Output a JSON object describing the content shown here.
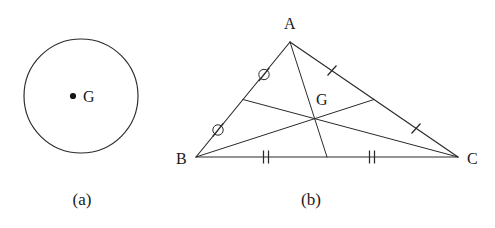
{
  "figure": {
    "width": 495,
    "height": 228,
    "background_color": "#ffffff",
    "stroke_color": "#2a2a2a",
    "text_color": "#1a1a1a"
  },
  "panel_a": {
    "caption": "(a)",
    "caption_x": 82,
    "caption_y": 205,
    "shape": "circle",
    "circle": {
      "cx": 81,
      "cy": 96,
      "r": 57
    },
    "center_point": {
      "label": "G",
      "dot_x": 73,
      "dot_y": 96,
      "dot_r": 3.1,
      "label_x": 83,
      "label_y": 102
    }
  },
  "panel_b": {
    "caption": "(b)",
    "caption_x": 311,
    "caption_y": 205,
    "shape": "triangle-with-medians",
    "vertices": [
      {
        "name": "A",
        "x": 290,
        "y": 42,
        "label": "A",
        "label_x": 284,
        "label_y": 29
      },
      {
        "name": "B",
        "x": 196,
        "y": 157,
        "label": "B",
        "label_x": 176,
        "label_y": 164
      },
      {
        "name": "C",
        "x": 458,
        "y": 157,
        "label": "C",
        "label_x": 467,
        "label_y": 164
      }
    ],
    "centroid": {
      "name": "G",
      "x": 315,
      "y": 119,
      "label": "G",
      "label_x": 316,
      "label_y": 105
    },
    "midpoints": [
      {
        "name": "midpoint-AB",
        "x": 243,
        "y": 99.5
      },
      {
        "name": "midpoint-AC",
        "x": 374,
        "y": 99.5
      },
      {
        "name": "midpoint-BC",
        "x": 327,
        "y": 157
      }
    ],
    "medians": [
      {
        "name": "median-A-to-BC",
        "from": "A",
        "to": "midpoint-BC"
      },
      {
        "name": "median-B-to-AC",
        "from": "B",
        "to": "midpoint-AC"
      },
      {
        "name": "median-C-to-AB",
        "from": "C",
        "to": "midpoint-AB"
      }
    ],
    "tick_marks": [
      {
        "name": "tick-AB-upper",
        "style": "circle-slash",
        "count": 1,
        "x": 264,
        "y": 74.5
      },
      {
        "name": "tick-AB-lower",
        "style": "circle-slash",
        "count": 1,
        "x": 218,
        "y": 130
      },
      {
        "name": "tick-AC-upper",
        "style": "single",
        "count": 1,
        "x": 332,
        "y": 70.5
      },
      {
        "name": "tick-AC-lower",
        "style": "single",
        "count": 1,
        "x": 416,
        "y": 128.5
      },
      {
        "name": "tick-BC-left",
        "style": "double",
        "count": 2,
        "x": 266,
        "y": 157
      },
      {
        "name": "tick-BC-right",
        "style": "double",
        "count": 2,
        "x": 372,
        "y": 157
      }
    ]
  }
}
